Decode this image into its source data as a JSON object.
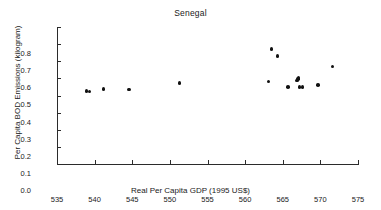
{
  "chart_data": {
    "type": "scatter",
    "title": "Senegal",
    "xlabel": "Real Per Capita GDP (1995 US$)",
    "ylabel": "Per Capita BOD Emissions (kilogram)",
    "xlim": [
      535,
      575
    ],
    "ylim": [
      0.0,
      0.8
    ],
    "xticks": [
      "535",
      "540",
      "545",
      "550",
      "555",
      "560",
      "565",
      "570",
      "575"
    ],
    "xtick_values": [
      535,
      540,
      545,
      550,
      555,
      560,
      565,
      570,
      575
    ],
    "yticks": [
      "0.0",
      "0.1",
      "0.2",
      "0.3",
      "0.4",
      "0.5",
      "0.6",
      "0.7",
      "0.8"
    ],
    "ytick_values": [
      0.0,
      0.1,
      0.2,
      0.3,
      0.4,
      0.5,
      0.6,
      0.7,
      0.8
    ],
    "grid": false,
    "legend": false,
    "marker": "filled-diamond",
    "marker_color": "#111111",
    "points": [
      {
        "x": 538.9,
        "y": 0.425
      },
      {
        "x": 539.3,
        "y": 0.424
      },
      {
        "x": 541.2,
        "y": 0.438
      },
      {
        "x": 544.6,
        "y": 0.436
      },
      {
        "x": 551.3,
        "y": 0.473
      },
      {
        "x": 563.1,
        "y": 0.481
      },
      {
        "x": 563.5,
        "y": 0.672
      },
      {
        "x": 564.3,
        "y": 0.63
      },
      {
        "x": 565.7,
        "y": 0.449
      },
      {
        "x": 566.9,
        "y": 0.487
      },
      {
        "x": 567.0,
        "y": 0.497
      },
      {
        "x": 567.1,
        "y": 0.503
      },
      {
        "x": 567.2,
        "y": 0.448
      },
      {
        "x": 567.6,
        "y": 0.448
      },
      {
        "x": 569.7,
        "y": 0.462
      },
      {
        "x": 571.6,
        "y": 0.57
      }
    ]
  }
}
